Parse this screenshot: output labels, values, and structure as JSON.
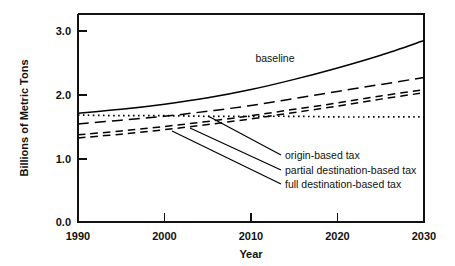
{
  "chart_data": {
    "type": "line",
    "title": "",
    "xlabel": "Year",
    "ylabel": "Billions of Metric Tons",
    "xlim": [
      1990,
      2030
    ],
    "ylim": [
      0.0,
      3.0
    ],
    "xticks": [
      "1990",
      "2000",
      "2010",
      "2020",
      "2030"
    ],
    "xtick_values": [
      1990,
      2000,
      2010,
      2020,
      2030
    ],
    "yticks": [
      "0.0",
      "1.0",
      "2.0",
      "3.0"
    ],
    "ytick_values": [
      0.0,
      1.0,
      2.0,
      3.0
    ],
    "grid": false,
    "legend_position": "inline-annotations",
    "x": [
      1990,
      1995,
      2000,
      2005,
      2010,
      2015,
      2020,
      2025,
      2030
    ],
    "series": [
      {
        "name": "baseline",
        "style": "solid",
        "values": [
          1.71,
          1.77,
          1.85,
          1.95,
          2.08,
          2.24,
          2.42,
          2.62,
          2.85
        ]
      },
      {
        "name": "1990 level",
        "style": "dotted",
        "values": [
          1.68,
          1.67,
          1.67,
          1.66,
          1.66,
          1.66,
          1.65,
          1.65,
          1.65
        ]
      },
      {
        "name": "origin-based tax",
        "style": "long-dash",
        "values": [
          1.54,
          1.6,
          1.66,
          1.74,
          1.83,
          1.94,
          2.05,
          2.16,
          2.27
        ]
      },
      {
        "name": "partial destination-based tax",
        "style": "dash",
        "values": [
          1.37,
          1.43,
          1.5,
          1.58,
          1.67,
          1.77,
          1.87,
          1.98,
          2.08
        ]
      },
      {
        "name": "full destination-based tax",
        "style": "dash",
        "values": [
          1.32,
          1.38,
          1.45,
          1.53,
          1.62,
          1.72,
          1.82,
          1.93,
          2.03
        ]
      }
    ],
    "annotations": [
      {
        "text": "baseline",
        "x": 2012,
        "y": 2.58
      },
      {
        "text": "origin-based tax",
        "x": 2016,
        "y": 1.28
      },
      {
        "text": "partial destination-based tax",
        "x": 2016,
        "y": 1.06
      },
      {
        "text": "full destination-based tax",
        "x": 2016,
        "y": 0.84
      }
    ]
  },
  "colors": {
    "ink": "#111111",
    "background": "#ffffff"
  }
}
